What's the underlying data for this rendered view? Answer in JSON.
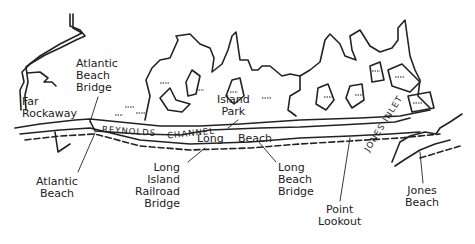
{
  "map": {
    "colors": {
      "ink": "#222222",
      "background": "#ffffff"
    },
    "labels": {
      "far_rockaway": "Far\nRockaway",
      "atlantic_beach_bridge": "Atlantic\nBeach\nBridge",
      "atlantic_beach": "Atlantic\nBeach",
      "island_park": "Island\nPark",
      "long": "Long",
      "beach": "Beach",
      "lirr_bridge": "Long\nIsland\nRailroad\nBridge",
      "long_beach_bridge": "Long\nBeach\nBridge",
      "point_lookout": "Point\nLookout",
      "jones_beach": "Jones\nBeach"
    },
    "water_labels": {
      "reynolds": "REYNOLDS",
      "channel": "CHANNEL",
      "jones_inlet": "JONES INLET"
    }
  }
}
